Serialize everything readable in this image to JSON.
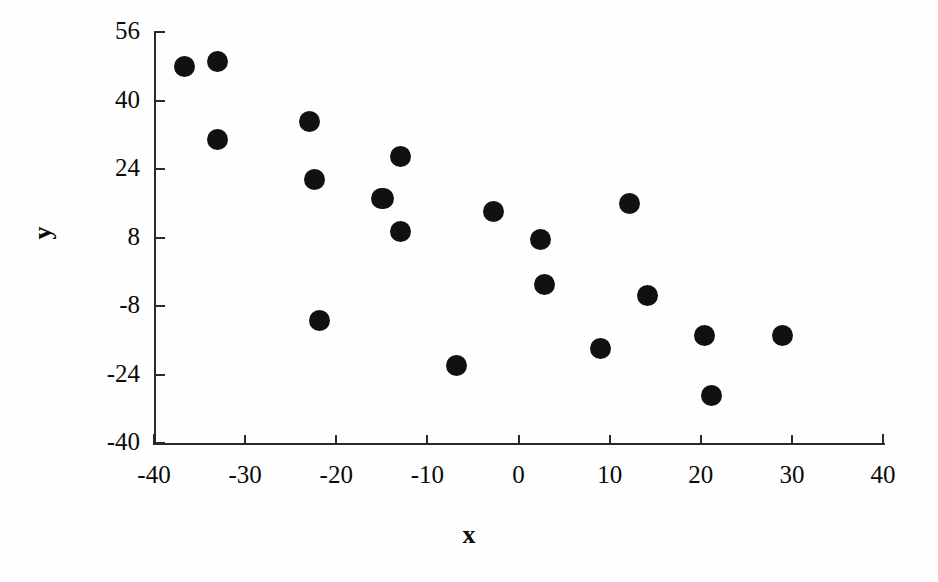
{
  "chart_data": {
    "type": "scatter",
    "title": "",
    "xlabel": "x",
    "ylabel": "y",
    "xlim": [
      -40,
      40
    ],
    "ylim": [
      -40,
      56
    ],
    "xticks": [
      -40,
      -30,
      -20,
      -10,
      0,
      10,
      20,
      30,
      40
    ],
    "yticks": [
      56,
      40,
      24,
      8,
      -8,
      -24,
      -40
    ],
    "xtick_labels": [
      "-40",
      "-30",
      "-20",
      "-10",
      "0",
      "10",
      "20",
      "30",
      "40"
    ],
    "ytick_labels": [
      "56",
      "40",
      "24",
      "8",
      "-8",
      "-24",
      "-40"
    ],
    "grid": false,
    "legend": "none",
    "marker": {
      "shape": "circle",
      "color": "#111111",
      "size": 21
    },
    "n_points": 20,
    "points": [
      {
        "x": -36.6,
        "y": 48.0
      },
      {
        "x": -33.0,
        "y": 49.0
      },
      {
        "x": -33.0,
        "y": 31.0
      },
      {
        "x": -22.9,
        "y": 35.0
      },
      {
        "x": -22.4,
        "y": 21.5
      },
      {
        "x": -21.8,
        "y": -11.5
      },
      {
        "x": -15.0,
        "y": 17.0
      },
      {
        "x": -14.8,
        "y": 17.0
      },
      {
        "x": -13.0,
        "y": 27.0
      },
      {
        "x": -12.9,
        "y": 9.5
      },
      {
        "x": -6.8,
        "y": -22.0
      },
      {
        "x": -2.7,
        "y": 14.0
      },
      {
        "x": 2.4,
        "y": 7.5
      },
      {
        "x": 2.8,
        "y": -3.0
      },
      {
        "x": 9.0,
        "y": -18.0
      },
      {
        "x": 12.2,
        "y": 16.0
      },
      {
        "x": 14.2,
        "y": -5.5
      },
      {
        "x": 20.4,
        "y": -15.0
      },
      {
        "x": 21.2,
        "y": -29.0
      },
      {
        "x": 29.0,
        "y": -15.0
      }
    ]
  }
}
